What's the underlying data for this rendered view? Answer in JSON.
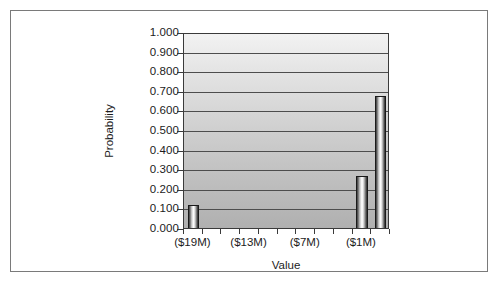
{
  "chart_data": {
    "type": "bar",
    "title": "",
    "xlabel": "Value",
    "ylabel": "Probability",
    "ylim": [
      0.0,
      1.0
    ],
    "ytick_step": 0.1,
    "ytick_labels": [
      "1.000",
      "0.900",
      "0.800",
      "0.700",
      "0.600",
      "0.500",
      "0.400",
      "0.300",
      "0.200",
      "0.100",
      "0.000"
    ],
    "ytick_values": [
      1.0,
      0.9,
      0.8,
      0.7,
      0.6,
      0.5,
      0.4,
      0.3,
      0.2,
      0.1,
      0.0
    ],
    "xtick_labels": [
      "($19M)",
      "($13M)",
      "($7M)",
      "($1M)"
    ],
    "categories": [
      "($19M)",
      "",
      "",
      "($13M)",
      "",
      "",
      "($7M)",
      "",
      "",
      "($1M)",
      ""
    ],
    "values": [
      0.115,
      0.0,
      0.0,
      0.0,
      0.0,
      0.0,
      0.0,
      0.0,
      0.0,
      0.265,
      0.675
    ],
    "bars": [
      {
        "category": "($19M)",
        "value": 0.115
      },
      {
        "category": "($1M)",
        "value": 0.265
      },
      {
        "category": "",
        "value": 0.675
      }
    ],
    "grid": true,
    "grid_axis": "y",
    "legend": false,
    "legend_position": "none",
    "bar_style": "cylinder",
    "colors": {
      "plot_background_top": "#f2f2f2",
      "plot_background_bottom": "#b0b0b0",
      "gridline": "#4d4d4d",
      "axis": "#3a3a3a",
      "bar_light": "#ffffff",
      "bar_dark": "#2e2e2e",
      "frame_border": "#7a7a7a",
      "text": "#1c1c1c",
      "page_background": "#ffffff"
    }
  }
}
